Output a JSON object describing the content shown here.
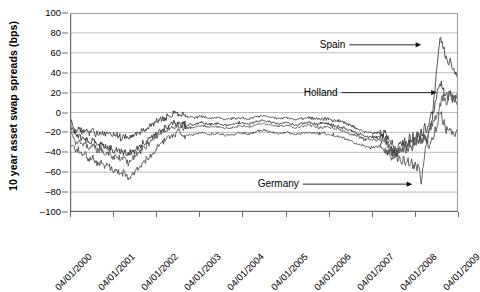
{
  "chart_data": {
    "type": "line",
    "title": "",
    "xlabel": "",
    "ylabel": "10 year asset swap spreads (bps)",
    "ylim": [
      -100,
      100
    ],
    "yticks": [
      100,
      80,
      60,
      40,
      20,
      0,
      -20,
      -40,
      -60,
      -80,
      -100
    ],
    "ytick_labels": [
      "100",
      "80",
      "60",
      "40",
      "20",
      "0",
      "–20",
      "–40",
      "–60",
      "–80",
      "–100"
    ],
    "grid": true,
    "legend_position": "none",
    "xlim": [
      "04/01/2000",
      "04/01/2009"
    ],
    "x": [
      "04/01/2000",
      "04/01/2001",
      "04/01/2002",
      "04/01/2003",
      "04/01/2004",
      "04/01/2005",
      "04/01/2006",
      "04/01/2007",
      "04/01/2008",
      "04/01/2009"
    ],
    "xtick_labels": [
      "04/01/2000",
      "04/01/2001",
      "04/01/2002",
      "04/01/2003",
      "04/01/2004",
      "04/01/2005",
      "04/01/2006",
      "04/01/2007",
      "04/01/2008",
      "04/01/2009"
    ],
    "annotations": [
      {
        "label": "Spain",
        "x": "mid 2009",
        "y": 68
      },
      {
        "label": "Holland",
        "x": "mid 2009",
        "y": 20
      },
      {
        "label": "Germany",
        "x": "late 2008",
        "y": -72
      }
    ],
    "series": [
      {
        "name": "Spain",
        "color": "#3a3a3a",
        "t": [
          0,
          0.008,
          0.016,
          0.024,
          0.032,
          0.04,
          0.05,
          0.06,
          0.07,
          0.08,
          0.09,
          0.1,
          0.11,
          0.12,
          0.13,
          0.14,
          0.15,
          0.16,
          0.17,
          0.18,
          0.19,
          0.2,
          0.21,
          0.22,
          0.23,
          0.24,
          0.25,
          0.26,
          0.27,
          0.28,
          0.29,
          0.3,
          0.32,
          0.34,
          0.36,
          0.38,
          0.4,
          0.42,
          0.44,
          0.46,
          0.48,
          0.5,
          0.52,
          0.54,
          0.56,
          0.58,
          0.6,
          0.62,
          0.64,
          0.66,
          0.68,
          0.7,
          0.72,
          0.74,
          0.76,
          0.78,
          0.8,
          0.81,
          0.82,
          0.83,
          0.84,
          0.85,
          0.855,
          0.86,
          0.87,
          0.875,
          0.88,
          0.885,
          0.89,
          0.895,
          0.9,
          0.905,
          0.91,
          0.915,
          0.92,
          0.925,
          0.93,
          0.935,
          0.94,
          0.945,
          0.95,
          0.955,
          0.96,
          0.965,
          0.97,
          0.975,
          0.98,
          0.985,
          0.99,
          0.995,
          1.0
        ],
        "v": [
          -9,
          -14,
          -18,
          -16,
          -20,
          -18,
          -21,
          -19,
          -22,
          -20,
          -23,
          -21,
          -24,
          -22,
          -25,
          -23,
          -26,
          -24,
          -22,
          -20,
          -18,
          -16,
          -13,
          -10,
          -8,
          -6,
          -4,
          -2,
          -1,
          0,
          -2,
          -4,
          -5,
          -4,
          -6,
          -5,
          -7,
          -6,
          -5,
          -7,
          -4,
          -3,
          -5,
          -6,
          -5,
          -7,
          -6,
          -5,
          -7,
          -6,
          -8,
          -9,
          -12,
          -16,
          -19,
          -21,
          -20,
          -22,
          -26,
          -33,
          -38,
          -30,
          -35,
          -28,
          -33,
          -25,
          -30,
          -22,
          -28,
          -20,
          -26,
          -18,
          -24,
          -15,
          -22,
          -10,
          -5,
          5,
          20,
          45,
          62,
          75,
          68,
          60,
          55,
          48,
          52,
          44,
          40,
          35,
          30
        ]
      },
      {
        "name": "Holland",
        "color": "#2e2e2e",
        "t": [
          0,
          0.008,
          0.016,
          0.024,
          0.032,
          0.04,
          0.05,
          0.06,
          0.07,
          0.08,
          0.09,
          0.1,
          0.11,
          0.12,
          0.13,
          0.14,
          0.15,
          0.16,
          0.17,
          0.18,
          0.19,
          0.2,
          0.21,
          0.22,
          0.23,
          0.24,
          0.25,
          0.26,
          0.27,
          0.28,
          0.29,
          0.3,
          0.32,
          0.34,
          0.36,
          0.38,
          0.4,
          0.42,
          0.44,
          0.46,
          0.48,
          0.5,
          0.52,
          0.54,
          0.56,
          0.58,
          0.6,
          0.62,
          0.64,
          0.66,
          0.68,
          0.7,
          0.72,
          0.74,
          0.76,
          0.78,
          0.8,
          0.81,
          0.82,
          0.83,
          0.84,
          0.85,
          0.855,
          0.86,
          0.87,
          0.875,
          0.88,
          0.885,
          0.89,
          0.895,
          0.9,
          0.905,
          0.91,
          0.915,
          0.92,
          0.925,
          0.93,
          0.935,
          0.94,
          0.945,
          0.95,
          0.955,
          0.96,
          0.965,
          0.97,
          0.975,
          0.98,
          0.985,
          0.99,
          0.995,
          1.0
        ],
        "v": [
          -12,
          -18,
          -24,
          -22,
          -27,
          -25,
          -30,
          -28,
          -33,
          -31,
          -36,
          -34,
          -38,
          -36,
          -41,
          -39,
          -43,
          -40,
          -37,
          -34,
          -31,
          -28,
          -25,
          -22,
          -19,
          -16,
          -14,
          -12,
          -11,
          -10,
          -12,
          -13,
          -12,
          -10,
          -12,
          -11,
          -13,
          -12,
          -10,
          -12,
          -9,
          -8,
          -10,
          -11,
          -10,
          -12,
          -11,
          -10,
          -12,
          -11,
          -13,
          -15,
          -18,
          -21,
          -24,
          -25,
          -24,
          -26,
          -30,
          -38,
          -42,
          -35,
          -40,
          -33,
          -38,
          -30,
          -36,
          -28,
          -34,
          -26,
          -32,
          -24,
          -30,
          -22,
          -28,
          -18,
          -14,
          -5,
          8,
          18,
          26,
          30,
          24,
          18,
          22,
          14,
          20,
          12,
          16,
          10,
          12
        ]
      },
      {
        "name": "Germany",
        "color": "#4a4a4a",
        "t": [
          0,
          0.008,
          0.016,
          0.024,
          0.032,
          0.04,
          0.05,
          0.06,
          0.07,
          0.08,
          0.09,
          0.1,
          0.11,
          0.12,
          0.13,
          0.14,
          0.15,
          0.16,
          0.17,
          0.18,
          0.19,
          0.2,
          0.21,
          0.22,
          0.23,
          0.24,
          0.25,
          0.26,
          0.27,
          0.28,
          0.29,
          0.3,
          0.32,
          0.34,
          0.36,
          0.38,
          0.4,
          0.42,
          0.44,
          0.46,
          0.48,
          0.5,
          0.52,
          0.54,
          0.56,
          0.58,
          0.6,
          0.62,
          0.64,
          0.66,
          0.68,
          0.7,
          0.72,
          0.74,
          0.76,
          0.78,
          0.8,
          0.81,
          0.82,
          0.83,
          0.84,
          0.845,
          0.85,
          0.855,
          0.86,
          0.865,
          0.87,
          0.875,
          0.88,
          0.885,
          0.89,
          0.895,
          0.9,
          0.905,
          0.91,
          0.915,
          0.92,
          0.925,
          0.93,
          0.935,
          0.94,
          0.945,
          0.95,
          0.955,
          0.96,
          0.965,
          0.97,
          0.975,
          0.98,
          0.985,
          0.99,
          0.995,
          1.0
        ],
        "v": [
          -30,
          -34,
          -40,
          -37,
          -44,
          -41,
          -48,
          -45,
          -52,
          -49,
          -56,
          -53,
          -60,
          -57,
          -63,
          -60,
          -66,
          -62,
          -58,
          -54,
          -50,
          -46,
          -42,
          -38,
          -34,
          -30,
          -27,
          -24,
          -22,
          -20,
          -22,
          -23,
          -22,
          -20,
          -22,
          -21,
          -23,
          -22,
          -20,
          -22,
          -19,
          -18,
          -20,
          -21,
          -20,
          -22,
          -21,
          -20,
          -22,
          -21,
          -23,
          -25,
          -28,
          -31,
          -34,
          -35,
          -34,
          -36,
          -40,
          -45,
          -42,
          -48,
          -44,
          -50,
          -46,
          -52,
          -48,
          -54,
          -50,
          -56,
          -52,
          -58,
          -54,
          -70,
          -55,
          -40,
          -30,
          -35,
          -25,
          -30,
          -20,
          -15,
          -5,
          0,
          -8,
          -14,
          -18,
          -16,
          -20,
          -17,
          -21,
          -18,
          -20
        ]
      },
      {
        "name": "fourth",
        "color": "#555555",
        "t": [
          0,
          0.008,
          0.016,
          0.024,
          0.032,
          0.04,
          0.05,
          0.06,
          0.07,
          0.08,
          0.09,
          0.1,
          0.11,
          0.12,
          0.13,
          0.14,
          0.15,
          0.16,
          0.17,
          0.18,
          0.19,
          0.2,
          0.21,
          0.22,
          0.23,
          0.24,
          0.25,
          0.26,
          0.27,
          0.28,
          0.29,
          0.3,
          0.32,
          0.34,
          0.36,
          0.38,
          0.4,
          0.42,
          0.44,
          0.46,
          0.48,
          0.5,
          0.52,
          0.54,
          0.56,
          0.58,
          0.6,
          0.62,
          0.64,
          0.66,
          0.68,
          0.7,
          0.72,
          0.74,
          0.76,
          0.78,
          0.8,
          0.81,
          0.82,
          0.83,
          0.84,
          0.85,
          0.86,
          0.87,
          0.88,
          0.89,
          0.9,
          0.91,
          0.92,
          0.93,
          0.94,
          0.95,
          0.96,
          0.97,
          0.98,
          0.99,
          1.0
        ],
        "v": [
          -20,
          -24,
          -30,
          -28,
          -33,
          -31,
          -36,
          -34,
          -39,
          -37,
          -42,
          -40,
          -45,
          -43,
          -48,
          -46,
          -50,
          -47,
          -43,
          -39,
          -35,
          -31,
          -28,
          -25,
          -22,
          -19,
          -17,
          -15,
          -14,
          -13,
          -15,
          -16,
          -15,
          -13,
          -15,
          -14,
          -16,
          -15,
          -13,
          -15,
          -12,
          -11,
          -13,
          -14,
          -13,
          -15,
          -14,
          -13,
          -15,
          -14,
          -16,
          -18,
          -21,
          -24,
          -27,
          -28,
          -27,
          -29,
          -33,
          -40,
          -44,
          -37,
          -36,
          -32,
          -34,
          -28,
          -30,
          -24,
          -26,
          -15,
          -8,
          4,
          16,
          10,
          20,
          12,
          18
        ]
      }
    ]
  }
}
